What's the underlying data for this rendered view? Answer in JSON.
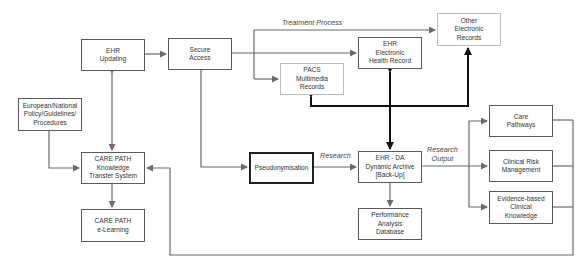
{
  "diagram": {
    "nodes": [
      {
        "id": "ehr_updating",
        "label": "EHR\nUpdating",
        "x": 81,
        "y": 39,
        "w": 64,
        "h": 32,
        "style": "solid"
      },
      {
        "id": "secure_access",
        "label": "Secure\nAccess",
        "x": 168,
        "y": 38,
        "w": 64,
        "h": 32,
        "style": "solid"
      },
      {
        "id": "ehr_record",
        "label": "EHR\nElectronic\nHealth Record",
        "x": 358,
        "y": 37,
        "w": 64,
        "h": 32,
        "style": "solid"
      },
      {
        "id": "other_records",
        "label": "Other\nElectronic\nRecords",
        "x": 437,
        "y": 13,
        "w": 64,
        "h": 33,
        "style": "dotted"
      },
      {
        "id": "pacs",
        "label": "PACS\nMultimedia\nRecords",
        "x": 280,
        "y": 63,
        "w": 64,
        "h": 32,
        "style": "dotted"
      },
      {
        "id": "european_policy",
        "label": "European/National\nPolicy/Guidelines/\nProcedures",
        "x": 18,
        "y": 98,
        "w": 64,
        "h": 33,
        "style": "solid"
      },
      {
        "id": "carepath_kts",
        "label": "CARE PATH\nKnowledge\nTransfer System",
        "x": 81,
        "y": 152,
        "w": 64,
        "h": 32,
        "style": "solid"
      },
      {
        "id": "carepath_elearning",
        "label": "CARE PATH\ne-Learning",
        "x": 81,
        "y": 209,
        "w": 64,
        "h": 33,
        "style": "solid"
      },
      {
        "id": "pseudonymisation",
        "label": "Pseudonymisation",
        "x": 249,
        "y": 152,
        "w": 65,
        "h": 32,
        "style": "bold"
      },
      {
        "id": "ehr_da",
        "label": "EHR - DA\nDynamic Archive\n[Back-Up]",
        "x": 358,
        "y": 151,
        "w": 64,
        "h": 32,
        "style": "solid"
      },
      {
        "id": "performance_db",
        "label": "Performance\nAnalysis\nDatabase",
        "x": 358,
        "y": 208,
        "w": 64,
        "h": 32,
        "style": "solid"
      },
      {
        "id": "care_pathways",
        "label": "Care\nPathways",
        "x": 489,
        "y": 105,
        "w": 64,
        "h": 32,
        "style": "solid"
      },
      {
        "id": "clinical_risk",
        "label": "Clinical Risk\nManagement",
        "x": 489,
        "y": 150,
        "w": 64,
        "h": 32,
        "style": "solid"
      },
      {
        "id": "evidence_knowledge",
        "label": "Evidence-based\nClinical\nKnowledge",
        "x": 489,
        "y": 191,
        "w": 64,
        "h": 33,
        "style": "solid"
      }
    ],
    "edge_labels": {
      "treatment_process": "Treatment Process",
      "research": "Research",
      "research_output": "Research\nOutput"
    },
    "colors": {
      "gray_line": "#6b6b6b",
      "black_line": "#111111",
      "box_border": "#5a5a5a",
      "dotted_border": "#bdbdbd",
      "text": "#333333"
    }
  }
}
